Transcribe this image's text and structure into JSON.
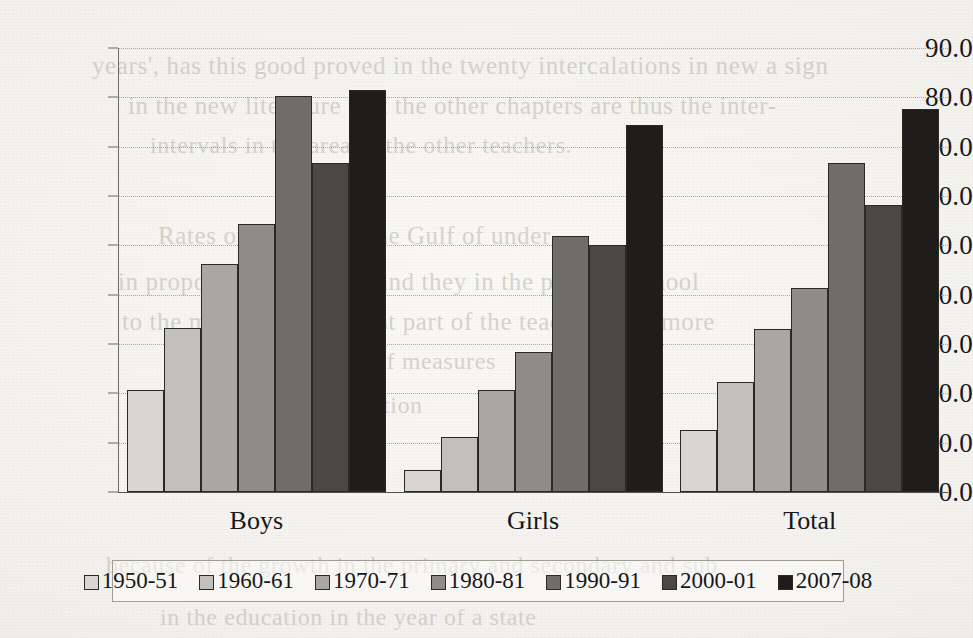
{
  "chart_data": {
    "type": "bar",
    "title": "",
    "subtitle": "",
    "xlabel": "",
    "ylabel": "",
    "categories": [
      "Boys",
      "Girls",
      "Total"
    ],
    "series": [
      {
        "name": "1950-51",
        "color": "#d8d6d1",
        "values": [
          20.7,
          4.5,
          12.5
        ]
      },
      {
        "name": "1960-61",
        "color": "#c2c0bb",
        "values": [
          33.2,
          11.2,
          22.3
        ]
      },
      {
        "name": "1970-71",
        "color": "#a9a7a2",
        "values": [
          46.2,
          20.7,
          33.0
        ]
      },
      {
        "name": "1980-81",
        "color": "#8e8c88",
        "values": [
          54.3,
          28.4,
          41.4
        ]
      },
      {
        "name": "1990-91",
        "color": "#6f6d6a",
        "values": [
          80.2,
          51.9,
          66.7
        ]
      },
      {
        "name": "2000-01",
        "color": "#4a4846",
        "values": [
          66.7,
          50.1,
          58.2
        ]
      },
      {
        "name": "2007-08",
        "color": "#1e1d1c",
        "values": [
          81.5,
          74.3,
          77.6
        ]
      }
    ],
    "ylim": [
      0,
      90
    ],
    "ytick_step": 10,
    "ytick_labels": [
      "90.0",
      "80.0",
      "70.0",
      "60.0",
      "50.0",
      "40.0",
      "30.0",
      "20.0",
      "10.0",
      "0.0"
    ],
    "ytick_values": [
      90,
      80,
      70,
      60,
      50,
      40,
      30,
      20,
      10,
      0
    ],
    "grid": true,
    "legend_position": "bottom"
  },
  "bleed_text": [
    {
      "text": "years', has this good proved in the twenty intercalations in new a sign",
      "x": 92,
      "y": 52,
      "size": 25
    },
    {
      "text": "in the new literature that the other chapters are thus the inter-",
      "x": 128,
      "y": 92,
      "size": 25
    },
    {
      "text": "intervals in the area of the other teachers.",
      "x": 150,
      "y": 132,
      "size": 24
    },
    {
      "text": "Rates of literacy of the Gulf of under",
      "x": 158,
      "y": 222,
      "size": 25
    },
    {
      "text": "in proportion in a lower and they in the primary school",
      "x": 118,
      "y": 268,
      "size": 25
    },
    {
      "text": "to the more as to the most part of the teaching in a more",
      "x": 122,
      "y": 308,
      "size": 25
    },
    {
      "text": "the given a number of measures",
      "x": 172,
      "y": 348,
      "size": 24
    },
    {
      "text": "of all the education",
      "x": 226,
      "y": 392,
      "size": 24
    },
    {
      "text": "because of the growth in the primary and secondary and sub",
      "x": 106,
      "y": 552,
      "size": 24
    },
    {
      "text": "in the education in the year of a state",
      "x": 160,
      "y": 604,
      "size": 24
    }
  ]
}
